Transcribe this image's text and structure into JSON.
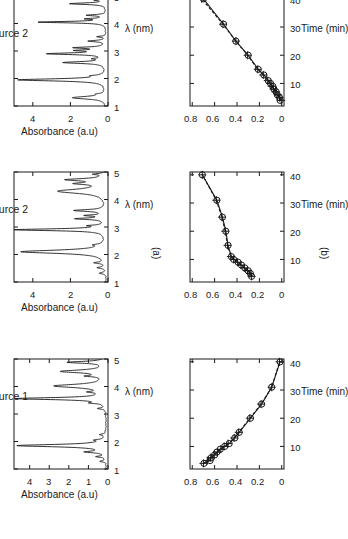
{
  "figure": {
    "orientation": "rotated-90-ccw",
    "background": "#ffffff",
    "ink": "#1a1a1a",
    "subpanel_labels": {
      "a": "(a)",
      "b": "(b)"
    }
  },
  "axis_titles": {
    "absorbance": "Absorbance (a.u)",
    "lambda": "λ (nm)",
    "time": "Time (min)"
  },
  "panel_titles": {
    "top": "Source 2",
    "middle": "Source 2",
    "bottom": "Source 1"
  },
  "chart_data": [
    {
      "id": "spectrum-source2-top",
      "type": "line",
      "title": "Source 2",
      "xlabel": "λ (nm)",
      "ylabel": "Absorbance (a.u)",
      "xlim": [
        1,
        5
      ],
      "ylim": [
        0,
        5
      ],
      "xticks": [
        1,
        2,
        3,
        4,
        5
      ],
      "yticks": [
        0,
        2,
        4
      ],
      "grid": false,
      "peaks": [
        {
          "x": 1.3,
          "y": 1.8,
          "w": 0.085
        },
        {
          "x": 1.43,
          "y": 0.3,
          "w": 0.04
        },
        {
          "x": 1.95,
          "y": 4.7,
          "w": 0.07
        },
        {
          "x": 2.1,
          "y": 0.45,
          "w": 0.04
        },
        {
          "x": 2.58,
          "y": 2.25,
          "w": 0.06
        },
        {
          "x": 2.72,
          "y": 0.5,
          "w": 0.035
        },
        {
          "x": 2.9,
          "y": 3.05,
          "w": 0.055
        },
        {
          "x": 3.02,
          "y": 1.35,
          "w": 0.04
        },
        {
          "x": 3.12,
          "y": 1.6,
          "w": 0.045
        },
        {
          "x": 3.36,
          "y": 0.95,
          "w": 0.045
        },
        {
          "x": 3.52,
          "y": 0.45,
          "w": 0.035
        },
        {
          "x": 4.05,
          "y": 3.6,
          "w": 0.045
        },
        {
          "x": 4.17,
          "y": 0.95,
          "w": 0.035
        },
        {
          "x": 4.3,
          "y": 1.0,
          "w": 0.04
        },
        {
          "x": 4.72,
          "y": 1.95,
          "w": 0.05
        },
        {
          "x": 4.85,
          "y": 0.55,
          "w": 0.035
        }
      ],
      "baseline": 0.06
    },
    {
      "id": "spectrum-source2-middle",
      "type": "line",
      "title": "Source 2",
      "xlabel": "λ (nm)",
      "ylabel": "Absorbance (a.u)",
      "xlim": [
        1,
        5
      ],
      "ylim": [
        0,
        5
      ],
      "xticks": [
        1,
        2,
        3,
        4,
        5
      ],
      "yticks": [
        0,
        2,
        4
      ],
      "grid": false,
      "peaks": [
        {
          "x": 1.32,
          "y": 0.35,
          "w": 0.045
        },
        {
          "x": 1.52,
          "y": 0.45,
          "w": 0.045
        },
        {
          "x": 1.7,
          "y": 0.55,
          "w": 0.045
        },
        {
          "x": 2.1,
          "y": 4.55,
          "w": 0.105
        },
        {
          "x": 2.35,
          "y": 0.4,
          "w": 0.045
        },
        {
          "x": 2.9,
          "y": 4.85,
          "w": 0.06
        },
        {
          "x": 3.05,
          "y": 0.7,
          "w": 0.035
        },
        {
          "x": 3.3,
          "y": 1.55,
          "w": 0.05
        },
        {
          "x": 3.42,
          "y": 0.95,
          "w": 0.04
        },
        {
          "x": 3.6,
          "y": 1.65,
          "w": 0.06
        },
        {
          "x": 4.3,
          "y": 2.55,
          "w": 0.14
        },
        {
          "x": 4.58,
          "y": 1.35,
          "w": 0.06
        },
        {
          "x": 4.72,
          "y": 2.0,
          "w": 0.07
        },
        {
          "x": 4.92,
          "y": 0.6,
          "w": 0.04
        }
      ],
      "baseline": 0.06
    },
    {
      "id": "spectrum-source1-bottom",
      "type": "line",
      "title": "Source 1",
      "xlabel": "λ (nm)",
      "ylabel": "Absorbance (a.u)",
      "xlim": [
        1,
        5
      ],
      "ylim": [
        0,
        4.8
      ],
      "xticks": [
        1,
        2,
        3,
        4,
        5
      ],
      "yticks": [
        0,
        1,
        2,
        3,
        4
      ],
      "grid": false,
      "peaks": [
        {
          "x": 1.28,
          "y": 0.3,
          "w": 0.04
        },
        {
          "x": 1.45,
          "y": 0.45,
          "w": 0.04
        },
        {
          "x": 1.62,
          "y": 0.95,
          "w": 0.05
        },
        {
          "x": 1.85,
          "y": 4.55,
          "w": 0.075
        },
        {
          "x": 2.05,
          "y": 0.4,
          "w": 0.04
        },
        {
          "x": 2.25,
          "y": 0.3,
          "w": 0.04
        },
        {
          "x": 3.2,
          "y": 0.35,
          "w": 0.04
        },
        {
          "x": 3.4,
          "y": 0.55,
          "w": 0.04
        },
        {
          "x": 3.56,
          "y": 4.6,
          "w": 0.065
        },
        {
          "x": 3.8,
          "y": 0.6,
          "w": 0.045
        },
        {
          "x": 4.02,
          "y": 2.6,
          "w": 0.11
        },
        {
          "x": 4.38,
          "y": 0.8,
          "w": 0.045
        },
        {
          "x": 4.55,
          "y": 2.25,
          "w": 0.09
        },
        {
          "x": 4.88,
          "y": 1.95,
          "w": 0.06
        }
      ],
      "baseline": 0.06
    },
    {
      "id": "kinetics-top",
      "type": "line",
      "xlabel": "Time (min)",
      "ylabel": "",
      "xlim": [
        2,
        41
      ],
      "ylim": [
        -0.02,
        0.82
      ],
      "xticks": [
        10,
        20,
        30,
        40
      ],
      "yticks": [
        0,
        0.2,
        0.4,
        0.6,
        0.8
      ],
      "grid": false,
      "markers": [
        "circle",
        "plus"
      ],
      "series": [
        {
          "name": "measured",
          "marker": "circle",
          "x": [
            4,
            5,
            6,
            7,
            8,
            9,
            10,
            11,
            13,
            15,
            20,
            25,
            31,
            40
          ],
          "y": [
            0.015,
            0.02,
            0.04,
            0.05,
            0.07,
            0.08,
            0.1,
            0.12,
            0.16,
            0.21,
            0.3,
            0.41,
            0.52,
            0.7
          ]
        },
        {
          "name": "model",
          "marker": "plus",
          "x": [
            4,
            5,
            6,
            7,
            8,
            9,
            10,
            11,
            13,
            15,
            20,
            25,
            31,
            40
          ],
          "y": [
            0.005,
            0.02,
            0.035,
            0.055,
            0.075,
            0.09,
            0.105,
            0.125,
            0.165,
            0.215,
            0.305,
            0.41,
            0.525,
            0.715
          ]
        }
      ]
    },
    {
      "id": "kinetics-middle",
      "type": "line",
      "xlabel": "Time (min)",
      "ylabel": "",
      "xlim": [
        2,
        41
      ],
      "ylim": [
        -0.02,
        0.82
      ],
      "xticks": [
        10,
        20,
        30,
        40
      ],
      "yticks": [
        0,
        0.2,
        0.4,
        0.6,
        0.8
      ],
      "grid": false,
      "markers": [
        "circle",
        "plus"
      ],
      "series": [
        {
          "name": "measured",
          "marker": "circle",
          "x": [
            4,
            5,
            6,
            7,
            8,
            9,
            10,
            11,
            15,
            20,
            25,
            31,
            40
          ],
          "y": [
            0.27,
            0.28,
            0.3,
            0.33,
            0.36,
            0.39,
            0.43,
            0.45,
            0.48,
            0.5,
            0.53,
            0.58,
            0.71
          ]
        },
        {
          "name": "model",
          "marker": "plus",
          "x": [
            4,
            5,
            6,
            7,
            8,
            9,
            10,
            11,
            15,
            20,
            25,
            31,
            40
          ],
          "y": [
            0.27,
            0.285,
            0.305,
            0.335,
            0.365,
            0.395,
            0.43,
            0.455,
            0.485,
            0.505,
            0.535,
            0.585,
            0.71
          ]
        }
      ]
    },
    {
      "id": "kinetics-bottom",
      "type": "line",
      "xlabel": "Time (min)",
      "ylabel": "",
      "xlim": [
        2,
        41
      ],
      "ylim": [
        -0.02,
        0.82
      ],
      "xticks": [
        10,
        20,
        30,
        40
      ],
      "yticks": [
        0,
        0.2,
        0.4,
        0.6,
        0.8
      ],
      "grid": false,
      "markers": [
        "circle",
        "plus"
      ],
      "series": [
        {
          "name": "measured",
          "marker": "circle",
          "x": [
            4,
            5,
            6,
            7,
            8,
            9,
            10,
            11,
            13,
            15,
            20,
            25,
            31,
            40
          ],
          "y": [
            0.695,
            0.64,
            0.63,
            0.6,
            0.58,
            0.55,
            0.51,
            0.47,
            0.42,
            0.38,
            0.28,
            0.18,
            0.09,
            0.015
          ]
        },
        {
          "name": "model",
          "marker": "plus",
          "x": [
            4,
            5,
            6,
            7,
            8,
            9,
            10,
            11,
            13,
            15,
            20,
            25,
            31,
            40
          ],
          "y": [
            0.7,
            0.665,
            0.635,
            0.605,
            0.575,
            0.545,
            0.515,
            0.48,
            0.425,
            0.385,
            0.285,
            0.185,
            0.09,
            0.02
          ]
        }
      ]
    }
  ]
}
